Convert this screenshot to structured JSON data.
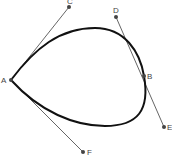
{
  "diagram": {
    "title": "",
    "points": {
      "A": {
        "label": "A",
        "x": 11,
        "y": 80
      },
      "B": {
        "label": "B",
        "x": 144,
        "y": 76
      },
      "C": {
        "label": "C",
        "x": 69,
        "y": 7
      },
      "D": {
        "label": "D",
        "x": 116,
        "y": 17
      },
      "E": {
        "label": "E",
        "x": 164,
        "y": 127
      },
      "F": {
        "label": "F",
        "x": 83,
        "y": 152
      }
    },
    "tangent_lines": [
      {
        "from": "A",
        "to": "C"
      },
      {
        "from": "A",
        "to": "F"
      },
      {
        "from": "D",
        "to": "E"
      }
    ],
    "colors": {
      "curve": "#111111",
      "tangent": "#666666",
      "point": "#444444"
    }
  }
}
